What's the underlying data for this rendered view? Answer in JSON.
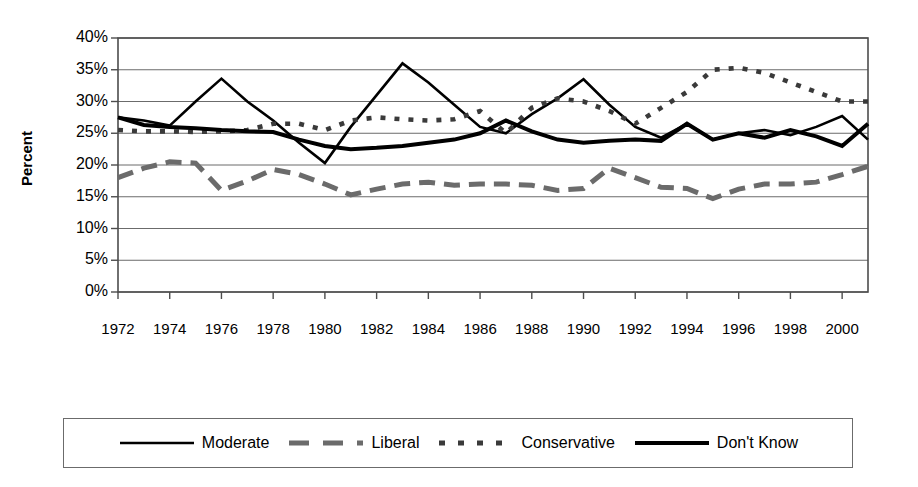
{
  "chart_data": {
    "type": "line",
    "title": "",
    "xlabel": "",
    "ylabel": "Percent",
    "grid": true,
    "legend_position": "bottom",
    "xlim": [
      1972,
      2001
    ],
    "ylim": [
      0,
      40
    ],
    "y_tick_labels": [
      "40%",
      "35%",
      "30%",
      "25%",
      "20%",
      "15%",
      "10%",
      "5%",
      "0%"
    ],
    "y_tick_values": [
      40,
      35,
      30,
      25,
      20,
      15,
      10,
      5,
      0
    ],
    "x_tick_labels": [
      "1972",
      "1974",
      "1976",
      "1978",
      "1980",
      "1982",
      "1984",
      "1986",
      "1988",
      "1990",
      "1992",
      "1994",
      "1996",
      "1998",
      "2000"
    ],
    "x_tick_values": [
      1972,
      1974,
      1976,
      1978,
      1980,
      1982,
      1984,
      1986,
      1988,
      1990,
      1992,
      1994,
      1996,
      1998,
      2000
    ],
    "x": [
      1972,
      1973,
      1974,
      1975,
      1976,
      1977,
      1978,
      1979,
      1980,
      1981,
      1982,
      1983,
      1984,
      1985,
      1986,
      1987,
      1988,
      1989,
      1990,
      1991,
      1992,
      1993,
      1994,
      1995,
      1996,
      1997,
      1998,
      1999,
      2000,
      2001
    ],
    "series": [
      {
        "name": "Moderate",
        "style": "solid-thin",
        "color": "#000000",
        "values": [
          27.5,
          27.0,
          26.2,
          30.0,
          33.6,
          30.0,
          27.0,
          23.5,
          20.3,
          26.0,
          31.0,
          36.0,
          33.0,
          29.5,
          26.0,
          25.0,
          28.0,
          30.5,
          33.5,
          29.5,
          26.0,
          24.3,
          26.5,
          24.0,
          25.0,
          25.5,
          24.7,
          26.0,
          27.7,
          24.0
        ]
      },
      {
        "name": "Liberal",
        "style": "dashed",
        "color": "#6b6b6b",
        "values": [
          18.0,
          19.5,
          20.5,
          20.3,
          16.0,
          17.5,
          19.3,
          18.5,
          17.0,
          15.3,
          16.2,
          17.0,
          17.3,
          16.8,
          17.0,
          17.0,
          16.8,
          16.0,
          16.3,
          19.5,
          18.0,
          16.5,
          16.3,
          14.7,
          16.2,
          17.0,
          17.0,
          17.3,
          18.5,
          19.8
        ]
      },
      {
        "name": "Conservative",
        "style": "dotted",
        "color": "#3a3a3a",
        "values": [
          25.5,
          25.3,
          25.3,
          25.2,
          25.3,
          25.5,
          26.5,
          26.5,
          25.5,
          27.0,
          27.5,
          27.2,
          27.0,
          27.2,
          28.5,
          25.0,
          29.0,
          30.5,
          30.0,
          28.5,
          26.5,
          29.0,
          31.5,
          35.0,
          35.3,
          34.5,
          33.0,
          31.5,
          30.0,
          30.0
        ]
      },
      {
        "name": "Don't Know",
        "style": "solid-thick",
        "color": "#000000",
        "values": [
          27.5,
          26.3,
          26.0,
          25.8,
          25.5,
          25.3,
          25.2,
          24.0,
          23.0,
          22.5,
          22.7,
          23.0,
          23.5,
          24.0,
          25.0,
          27.0,
          25.3,
          24.0,
          23.5,
          23.8,
          24.0,
          23.8,
          26.5,
          24.0,
          25.0,
          24.3,
          25.5,
          24.5,
          23.0,
          26.5
        ]
      }
    ]
  },
  "legend": {
    "items": [
      {
        "label": "Moderate",
        "swatch": "solid-thin-line-icon"
      },
      {
        "label": "Liberal",
        "swatch": "dashed-line-icon"
      },
      {
        "label": "Conservative",
        "swatch": "dotted-line-icon"
      },
      {
        "label": "Don't Know",
        "swatch": "solid-thick-line-icon"
      }
    ]
  },
  "colors": {
    "axis": "#4d4d4d",
    "grid": "#6b6b6b",
    "moderate": "#000000",
    "liberal": "#6b6b6b",
    "conservative": "#3a3a3a",
    "dont_know": "#000000"
  }
}
